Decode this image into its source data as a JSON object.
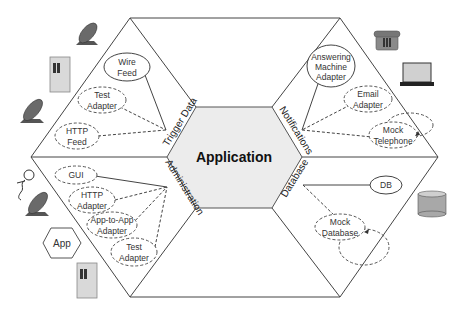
{
  "center": {
    "label": "Application"
  },
  "ports": {
    "trigger": "Trigger Data",
    "notifications": "Notifications",
    "database": "Database",
    "administration": "Administration"
  },
  "adapters": {
    "wire_feed": [
      "Wire",
      "Feed"
    ],
    "test_adapter_trigger": [
      "Test",
      "Adapter"
    ],
    "http_feed": [
      "HTTP",
      "Feed"
    ],
    "answering_machine": [
      "Answering",
      "Machine",
      "Adapter"
    ],
    "email_adapter": [
      "Email",
      "Adapter"
    ],
    "mock_telephone": [
      "Mock",
      "Telephone"
    ],
    "db": "DB",
    "mock_database": [
      "Mock",
      "Database"
    ],
    "gui": "GUI",
    "http_adapter": [
      "HTTP",
      "Adapter"
    ],
    "app_to_app": [
      "App-to-App",
      "Adapter"
    ],
    "test_adapter_admin": [
      "Test",
      "Adapter"
    ]
  },
  "actors": {
    "app_hex": "App"
  },
  "colors": {
    "center_fill": "#ececec",
    "line": "#444444",
    "icon_gray": "#8a8a8a"
  }
}
